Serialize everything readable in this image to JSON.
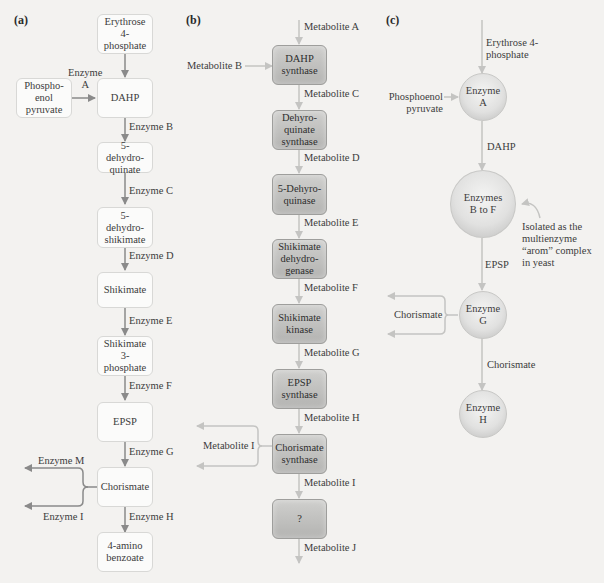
{
  "panels": {
    "a": {
      "label": "(a)",
      "nodes": {
        "erythrose": "Erythrose\n4-\nphosphate",
        "pep": "Phospho-\nenol\npyruvate",
        "dahp": "DAHP",
        "dehydroquinate": "5-\ndehydro-\nquinate",
        "dehydroshikimate": "5-\ndehydro-\nshikimate",
        "shikimate": "Shikimate",
        "shikimate3p": "Shikimate\n3-\nphosphate",
        "epsp": "EPSP",
        "chorismate": "Chorismate",
        "aminobenzoate": "4-amino\nbenzoate"
      },
      "edges": {
        "enzyme_a": "Enzyme\nA",
        "enzyme_b": "Enzyme B",
        "enzyme_c": "Enzyme C",
        "enzyme_d": "Enzyme D",
        "enzyme_e": "Enzyme E",
        "enzyme_f": "Enzyme F",
        "enzyme_g": "Enzyme G",
        "enzyme_h": "Enzyme H",
        "enzyme_m": "Enzyme M",
        "enzyme_i": "Enzyme I"
      }
    },
    "b": {
      "label": "(b)",
      "nodes": {
        "dahp_synthase": "DAHP\nsynthase",
        "dehydroquinate_synthase": "Dehyro-\nquinate\nsynthase",
        "dehydroquinase": "5-Dehyro-\nquinase",
        "shikimate_dehydrogenase": "Shikimate\ndehydro-\ngenase",
        "shikimate_kinase": "Shikimate\nkinase",
        "epsp_synthase": "EPSP\nsynthase",
        "chorismate_synthase": "Chorismate\nsynthase",
        "unknown": "?"
      },
      "edges": {
        "met_a": "Metabolite A",
        "met_b": "Metabolite B",
        "met_c": "Metabolite C",
        "met_d": "Metabolite D",
        "met_e": "Metabolite E",
        "met_f": "Metabolite F",
        "met_g": "Metabolite G",
        "met_h": "Metabolite H",
        "met_i_branch": "Metabolite I",
        "met_i": "Metabolite I",
        "met_j": "Metabolite J"
      }
    },
    "c": {
      "label": "(c)",
      "nodes": {
        "enzyme_a": "Enzyme\nA",
        "enzymes_b_f": "Enzymes\nB to F",
        "enzyme_g": "Enzyme\nG",
        "enzyme_h": "Enzyme\nH"
      },
      "edges": {
        "erythrose": "Erythrose 4-\nphosphate",
        "pep": "Phosphoenol\npyruvate",
        "dahp": "DAHP",
        "epsp": "EPSP",
        "chorismate_branch": "Chorismate",
        "chorismate": "Chorismate"
      },
      "annotation": "Isolated as the\nmultienzyme\n“arom” complex\nin yeast"
    }
  },
  "colors": {
    "background": "#f3f2f0",
    "arrow_a": "#8a8a8a",
    "arrow_bc": "#c4c4c2",
    "box_b_fill": "#c2c2c0"
  }
}
